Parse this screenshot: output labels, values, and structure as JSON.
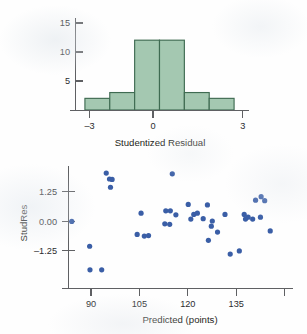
{
  "figure": {
    "name": "residual-diagnostics-figure",
    "panels": [
      "histogram-panel",
      "scatterplot-panel"
    ]
  },
  "colors": {
    "bar_fill": "#a4c8b1",
    "bar_stroke": "#3f6b52",
    "point_fill": "#3a5ea6",
    "axis": "#5f6063",
    "text": "#1f1f21",
    "background": "#fefefe"
  },
  "chart_data": [
    {
      "type": "bar",
      "name": "studentized-residual-histogram",
      "title": "",
      "xlabel": "Studentized Residual",
      "ylabel": "",
      "categories": [
        "-3 to -2",
        "-2 to -1",
        "-1 to 0",
        "0 to 1",
        "1 to 2",
        "2 to 3"
      ],
      "bin_edges": [
        -3,
        -2,
        -1,
        0,
        1,
        2,
        3
      ],
      "values": [
        2,
        3,
        12,
        12,
        3,
        2
      ],
      "xlim": [
        -3.6,
        3.6
      ],
      "ylim": [
        0,
        16.5
      ],
      "xticks": [
        -3,
        0,
        3
      ],
      "xticklabels": [
        "–3",
        "0",
        "3"
      ],
      "yticks": [
        5,
        10,
        15
      ],
      "yticklabels": [
        "5",
        "10",
        "15"
      ],
      "grid": false,
      "legend": false
    },
    {
      "type": "scatter",
      "name": "studres-vs-predicted-scatterplot",
      "title": "",
      "xlabel": "Predicted (points)",
      "ylabel": "StudRes",
      "xlim": [
        81,
        152
      ],
      "ylim": [
        -2.65,
        2.35
      ],
      "xticks": [
        90,
        105,
        120,
        135,
        150
      ],
      "xticklabels": [
        "90",
        "105",
        "120",
        "135",
        ""
      ],
      "yticks": [
        1.25,
        0.0,
        -1.25
      ],
      "yticklabels": [
        "1.25",
        "0.00",
        "–1.25"
      ],
      "grid": false,
      "legend": false,
      "points": [
        [
          84.0,
          0.0
        ],
        [
          89.5,
          -1.05
        ],
        [
          89.6,
          -2.05
        ],
        [
          93.2,
          -2.05
        ],
        [
          94.6,
          2.05
        ],
        [
          95.6,
          1.8
        ],
        [
          96.4,
          1.78
        ],
        [
          95.9,
          1.45
        ],
        [
          105.3,
          0.35
        ],
        [
          104.1,
          -0.55
        ],
        [
          106.3,
          -0.62
        ],
        [
          107.6,
          -0.6
        ],
        [
          114.9,
          2.02
        ],
        [
          112.9,
          0.45
        ],
        [
          114.3,
          0.45
        ],
        [
          116.0,
          0.28
        ],
        [
          112.6,
          -0.1
        ],
        [
          114.1,
          -0.12
        ],
        [
          119.8,
          0.72
        ],
        [
          121.5,
          0.3
        ],
        [
          122.6,
          0.35
        ],
        [
          120.6,
          0.1
        ],
        [
          124.4,
          0.12
        ],
        [
          125.7,
          0.7
        ],
        [
          127.2,
          0.02
        ],
        [
          126.9,
          -0.2
        ],
        [
          126.0,
          -0.8
        ],
        [
          128.8,
          -0.45
        ],
        [
          131.1,
          0.3
        ],
        [
          132.7,
          -1.38
        ],
        [
          135.5,
          -1.25
        ],
        [
          137.0,
          0.3
        ],
        [
          137.4,
          0.1
        ],
        [
          138.2,
          0.18
        ],
        [
          140.5,
          0.9
        ],
        [
          139.6,
          0.1
        ],
        [
          142.2,
          1.05
        ],
        [
          143.3,
          0.88
        ],
        [
          142.0,
          0.18
        ],
        [
          145.0,
          -0.4
        ]
      ]
    }
  ]
}
